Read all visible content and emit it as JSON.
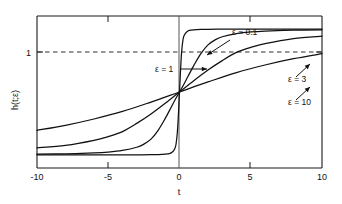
{
  "chart_data": {
    "type": "line",
    "title": "",
    "xlabel": "t",
    "ylabel": "h(t;ε)",
    "xlim": [
      -10,
      10
    ],
    "ylim": [
      -0.105,
      1.105
    ],
    "grid": false,
    "legend_position": "inline-annotations",
    "x_ticks": [
      -10,
      -5,
      0,
      5,
      10
    ],
    "x_tick_labels": [
      "-10",
      "-5",
      "0",
      "5",
      "10"
    ],
    "y_ticks": [
      1
    ],
    "y_tick_labels": [
      "1"
    ],
    "reference_lines": [
      {
        "name": "y-equals-one",
        "orientation": "horizontal",
        "value": 1,
        "style": "dashed"
      },
      {
        "name": "t-equals-zero",
        "orientation": "vertical",
        "value": 0,
        "style": "solid"
      }
    ],
    "crossing_point": {
      "t": 0,
      "h": 0.5
    },
    "series": [
      {
        "name": "ε = 0.1",
        "epsilon": 0.1,
        "label": "ε = 0.1",
        "x": [
          -10,
          -8,
          -6,
          -4,
          -3,
          -2,
          -1.5,
          -1,
          -0.7,
          -0.5,
          -0.35,
          -0.25,
          -0.15,
          -0.08,
          -0.03,
          0,
          0.03,
          0.08,
          0.15,
          0.25,
          0.35,
          0.5,
          0.7,
          1,
          1.5,
          2,
          3,
          4,
          6,
          8,
          10
        ],
        "y": [
          0.0,
          0.0,
          0.0,
          0.0,
          0.0,
          0.001,
          0.002,
          0.005,
          0.01,
          0.022,
          0.045,
          0.08,
          0.18,
          0.31,
          0.43,
          0.5,
          0.57,
          0.69,
          0.82,
          0.92,
          0.955,
          0.978,
          0.99,
          0.995,
          0.998,
          0.999,
          1.0,
          1.0,
          1.0,
          1.0,
          1.0
        ]
      },
      {
        "name": "ε = 1",
        "epsilon": 1,
        "label": "ε = 1",
        "x": [
          -10,
          -8,
          -6,
          -5,
          -4,
          -3,
          -2.5,
          -2,
          -1.5,
          -1,
          -0.6,
          -0.3,
          0,
          0.3,
          0.6,
          1,
          1.5,
          2,
          2.5,
          3,
          4,
          5,
          6,
          8,
          10
        ],
        "y": [
          0.005,
          0.008,
          0.015,
          0.022,
          0.035,
          0.06,
          0.085,
          0.125,
          0.195,
          0.29,
          0.375,
          0.44,
          0.5,
          0.56,
          0.625,
          0.71,
          0.805,
          0.875,
          0.915,
          0.94,
          0.965,
          0.978,
          0.985,
          0.992,
          0.995
        ]
      },
      {
        "name": "ε = 3",
        "epsilon": 3,
        "label": "ε = 3",
        "x": [
          -10,
          -8,
          -6,
          -5,
          -4,
          -3,
          -2,
          -1,
          0,
          1,
          2,
          3,
          4,
          5,
          6,
          8,
          10
        ],
        "y": [
          0.055,
          0.075,
          0.115,
          0.145,
          0.185,
          0.25,
          0.325,
          0.41,
          0.5,
          0.59,
          0.675,
          0.75,
          0.815,
          0.855,
          0.885,
          0.925,
          0.945
        ]
      },
      {
        "name": "ε = 10",
        "epsilon": 10,
        "label": "ε = 10",
        "x": [
          -10,
          -8,
          -6,
          -4,
          -2,
          0,
          2,
          4,
          6,
          8,
          10
        ],
        "y": [
          0.195,
          0.235,
          0.285,
          0.345,
          0.42,
          0.5,
          0.58,
          0.655,
          0.715,
          0.765,
          0.805
        ]
      }
    ],
    "annotations": [
      {
        "name": "annotation-epsilon-0-1",
        "text": "ε = 0.1",
        "text_x": 232,
        "text_y": 35,
        "arrow_from_x": 230,
        "arrow_from_y": 40,
        "arrow_to_x": 207,
        "arrow_to_y": 55
      },
      {
        "name": "annotation-epsilon-1",
        "text": "ε = 1",
        "text_x": 155,
        "text_y": 72,
        "arrow_from_x": 180,
        "arrow_from_y": 69,
        "arrow_to_x": 207,
        "arrow_to_y": 69
      },
      {
        "name": "annotation-epsilon-3",
        "text": "ε = 3",
        "text_x": 288,
        "text_y": 82,
        "arrow_from_x": 296,
        "arrow_from_y": 77,
        "arrow_to_x": 310,
        "arrow_to_y": 64
      },
      {
        "name": "annotation-epsilon-10",
        "text": "ε = 10",
        "text_x": 288,
        "text_y": 105,
        "arrow_from_x": 296,
        "arrow_from_y": 100,
        "arrow_to_x": 310,
        "arrow_to_y": 87
      }
    ],
    "colors": {
      "axis": "#1a1a1a",
      "curve": "#111111",
      "dashed_reference": "#444444",
      "background": "#ffffff",
      "text": "#111111"
    }
  }
}
